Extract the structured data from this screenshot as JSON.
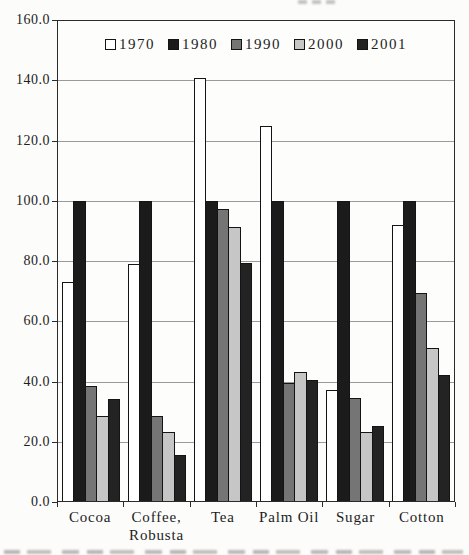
{
  "chart_data": {
    "type": "bar",
    "title": "",
    "categories": [
      "Cocoa",
      "Coffee,\nRobusta",
      "Tea",
      "Palm Oil",
      "Sugar",
      "Cotton"
    ],
    "series": [
      {
        "name": "1970",
        "color": "#ffffff",
        "values": [
          73,
          79,
          141,
          125,
          37,
          92
        ]
      },
      {
        "name": "1980",
        "color": "#1b1b1b",
        "values": [
          100,
          100,
          100,
          100,
          100,
          100
        ]
      },
      {
        "name": "1990",
        "color": "#757575",
        "values": [
          38.5,
          28.5,
          97.5,
          39.5,
          34.5,
          69.5
        ]
      },
      {
        "name": "2000",
        "color": "#c6c6c6",
        "values": [
          28.5,
          23,
          91.5,
          43,
          23,
          51
        ]
      },
      {
        "name": "2001",
        "color": "#232323",
        "values": [
          34,
          15.5,
          79.5,
          40.5,
          25,
          42
        ]
      }
    ],
    "ylim": [
      0,
      160
    ],
    "ytick_step": 20,
    "ytick_labels": [
      "0.0",
      "20.0",
      "40.0",
      "60.0",
      "80.0",
      "100.0",
      "120.0",
      "140.0",
      "160.0"
    ],
    "grid": true,
    "legend_position": "top-center-inside",
    "xlabel": "",
    "ylabel": ""
  },
  "style": {
    "axis_color": "#2b2b2b",
    "grid_color": "#9a9a9a",
    "bar_border_color": "#141414",
    "background": "#fcfcfb"
  }
}
